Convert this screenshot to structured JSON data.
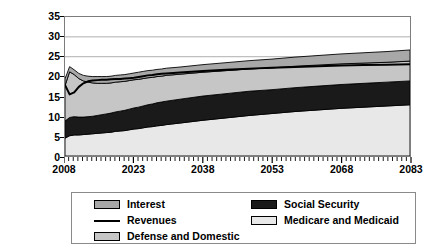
{
  "chart_data": {
    "type": "area",
    "title": "",
    "subtitle": "",
    "xlabel": "",
    "ylabel": "Percentage of Gross Domestic Product",
    "ylabel_lines": [
      "Percentage of",
      "Gross Domestic Product"
    ],
    "xlim": [
      2008,
      2083
    ],
    "ylim": [
      0,
      35
    ],
    "ytick_labels": [
      "0",
      "5",
      "10",
      "15",
      "20",
      "25",
      "30",
      "35"
    ],
    "ytick_values": [
      0,
      5,
      10,
      15,
      20,
      25,
      30,
      35
    ],
    "xtick_labels": [
      "2008",
      "2023",
      "2038",
      "2053",
      "2068",
      "2083"
    ],
    "xtick_values": [
      2008,
      2023,
      2038,
      2053,
      2068,
      2083
    ],
    "xminor_tick_step": 1,
    "grid": "horizontal",
    "stacked": true,
    "stack_order_bottom_to_top": [
      "Medicare and Medicaid",
      "Social Security",
      "Defense and Domestic",
      "Interest"
    ],
    "legend_position": "below",
    "x": [
      2008,
      2009,
      2010,
      2011,
      2012,
      2013,
      2014,
      2015,
      2016,
      2017,
      2018,
      2019,
      2020,
      2021,
      2022,
      2023,
      2024,
      2025,
      2026,
      2027,
      2028,
      2029,
      2030,
      2033,
      2038,
      2043,
      2048,
      2053,
      2058,
      2063,
      2068,
      2073,
      2078,
      2083
    ],
    "series": [
      {
        "name": "Medicare and Medicaid",
        "color": "#e8e8e8",
        "type": "stacked-area",
        "values": [
          4.5,
          5.1,
          5.3,
          5.3,
          5.4,
          5.5,
          5.6,
          5.7,
          5.8,
          5.9,
          6.0,
          6.2,
          6.3,
          6.4,
          6.6,
          6.8,
          6.9,
          7.1,
          7.3,
          7.4,
          7.6,
          7.7,
          7.9,
          8.3,
          9.0,
          9.6,
          10.2,
          10.7,
          11.2,
          11.6,
          12.0,
          12.3,
          12.6,
          12.9
        ]
      },
      {
        "name": "Social Security",
        "color": "#1a1a1a",
        "type": "stacked-area",
        "values": [
          4.3,
          4.6,
          4.6,
          4.5,
          4.4,
          4.4,
          4.4,
          4.5,
          4.6,
          4.7,
          4.8,
          4.9,
          5.0,
          5.1,
          5.2,
          5.3,
          5.4,
          5.5,
          5.6,
          5.7,
          5.8,
          5.9,
          5.9,
          6.0,
          6.1,
          6.1,
          6.1,
          6.0,
          6.0,
          6.0,
          6.0,
          6.0,
          6.0,
          6.0
        ]
      },
      {
        "name": "Defense and Domestic",
        "color": "#c6c6c6",
        "type": "stacked-area",
        "values": [
          8.9,
          11.5,
          10.6,
          9.7,
          9.1,
          8.7,
          8.4,
          8.1,
          7.9,
          7.7,
          7.6,
          7.5,
          7.4,
          7.3,
          7.2,
          7.1,
          7.0,
          6.9,
          6.8,
          6.7,
          6.6,
          6.5,
          6.5,
          6.3,
          6.0,
          5.8,
          5.6,
          5.5,
          5.4,
          5.3,
          5.2,
          5.1,
          5.0,
          5.0
        ]
      },
      {
        "name": "Interest",
        "color": "#a8a8a8",
        "type": "stacked-area",
        "values": [
          1.7,
          1.3,
          1.2,
          1.3,
          1.4,
          1.5,
          1.6,
          1.7,
          1.7,
          1.7,
          1.7,
          1.7,
          1.7,
          1.7,
          1.7,
          1.7,
          1.8,
          1.8,
          1.8,
          1.8,
          1.8,
          1.8,
          1.8,
          1.8,
          1.9,
          2.0,
          2.1,
          2.2,
          2.3,
          2.4,
          2.5,
          2.6,
          2.7,
          2.8
        ]
      },
      {
        "name": "Revenues",
        "color": "#000000",
        "type": "line",
        "values": [
          17.9,
          15.5,
          16.0,
          17.4,
          18.3,
          18.8,
          19.0,
          19.1,
          19.2,
          19.2,
          19.3,
          19.4,
          19.4,
          19.5,
          19.6,
          19.7,
          19.9,
          20.1,
          20.3,
          20.4,
          20.6,
          20.7,
          20.8,
          21.0,
          21.4,
          21.7,
          22.0,
          22.2,
          22.4,
          22.6,
          22.8,
          22.9,
          23.0,
          23.1
        ]
      }
    ]
  },
  "legend": {
    "items_left": [
      {
        "label": "Interest",
        "swatch": "fill",
        "color": "#a8a8a8"
      },
      {
        "label": "Revenues",
        "swatch": "line",
        "color": "#000000"
      },
      {
        "label": "Defense and Domestic",
        "swatch": "fill",
        "color": "#c6c6c6"
      }
    ],
    "items_right": [
      {
        "label": "Social Security",
        "swatch": "fill",
        "color": "#1a1a1a"
      },
      {
        "label": "Medicare and Medicaid",
        "swatch": "fill",
        "color": "#e8e8e8"
      }
    ]
  }
}
